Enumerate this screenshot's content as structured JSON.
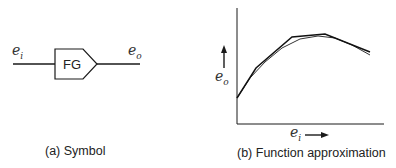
{
  "symbol_panel": {
    "caption": "(a) Symbol",
    "block_label": "FG",
    "input_label": {
      "base": "e",
      "sub": "i"
    },
    "output_label": {
      "base": "e",
      "sub": "o"
    }
  },
  "approx_panel": {
    "caption": "(b) Function approximation",
    "y_axis_label": {
      "base": "e",
      "sub": "o"
    },
    "x_axis_label": {
      "base": "e",
      "sub": "i"
    },
    "piecewise_points": [
      [
        237,
        98
      ],
      [
        256,
        68
      ],
      [
        292,
        37
      ],
      [
        325,
        34
      ],
      [
        370,
        52
      ]
    ],
    "smooth_curve_points": [
      [
        237,
        98
      ],
      [
        250,
        78
      ],
      [
        265,
        62
      ],
      [
        282,
        48
      ],
      [
        300,
        39
      ],
      [
        318,
        36
      ],
      [
        335,
        38
      ],
      [
        352,
        45
      ],
      [
        370,
        55
      ]
    ]
  },
  "colors": {
    "line": "#1a1a1a",
    "background": "#ffffff"
  }
}
